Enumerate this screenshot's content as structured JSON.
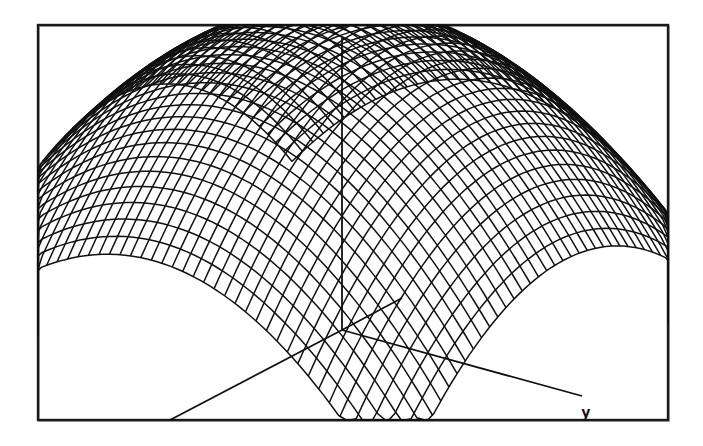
{
  "chart_data": {
    "type": "surface-wireframe",
    "title": "",
    "surface": "z = 1 - (x^2 + y^2) (inverted paraboloid dome)",
    "grid": {
      "x_lines": 44,
      "y_lines": 44,
      "x_range": [
        -1,
        1
      ],
      "y_range": [
        -1,
        1
      ]
    },
    "axes": {
      "x": {
        "label": ""
      },
      "y": {
        "label": "y"
      },
      "z": {
        "label": ""
      }
    },
    "legend": null,
    "colors": {
      "mesh": "#111111",
      "frame": "#1a1a1a",
      "background": "#ffffff"
    }
  },
  "frame": {
    "x": 38,
    "y": 25,
    "width": 630,
    "height": 395
  },
  "projection": {
    "origin": [
      342,
      330
    ],
    "x_dir": [
      -1.0,
      0.5
    ],
    "y_dir": [
      1.25,
      0.45
    ],
    "z_dir": [
      0,
      -1
    ],
    "x_scale": 175,
    "y_scale": 180,
    "z_scale": 305
  },
  "axis_lines": {
    "z": {
      "x1": 342,
      "y1": 330,
      "x2": 342,
      "y2": 38
    },
    "x": {
      "x1": 342,
      "y1": 330,
      "x2": 170,
      "y2": 420
    },
    "y": {
      "x1": 342,
      "y1": 330,
      "x2": 582,
      "y2": 396
    },
    "x_back": {
      "x1": 342,
      "y1": 330,
      "x2": 402,
      "y2": 298
    }
  },
  "labels": {
    "y_axis": {
      "text": "y",
      "x": 581,
      "y": 418
    }
  }
}
